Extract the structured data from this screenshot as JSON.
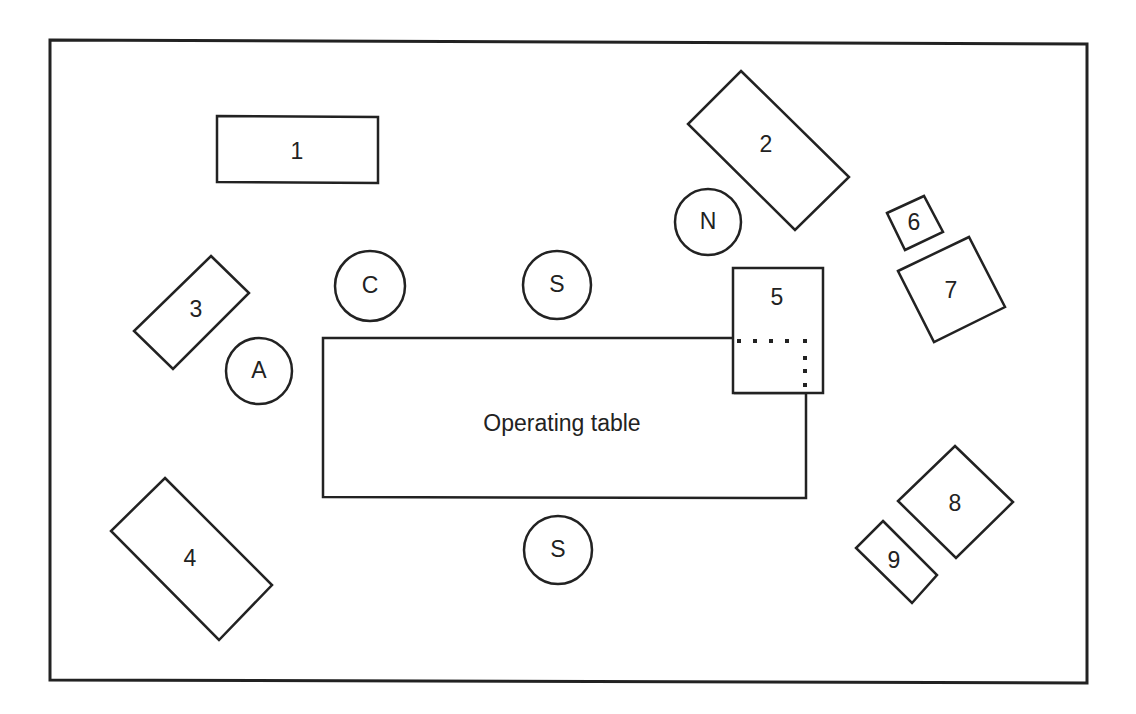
{
  "diagram": {
    "colors": {
      "stroke": "#222222",
      "background": "#ffffff"
    },
    "room": {
      "points": [
        [
          50,
          40
        ],
        [
          1087,
          44
        ],
        [
          1087,
          683
        ],
        [
          50,
          680
        ]
      ]
    },
    "table": {
      "label": "Operating table",
      "points": [
        [
          323,
          338
        ],
        [
          735,
          338
        ],
        [
          735,
          393
        ],
        [
          806,
          393
        ],
        [
          806,
          498
        ],
        [
          323,
          497
        ]
      ],
      "label_x": 562,
      "label_y": 425
    },
    "table_extension": {
      "dots": [
        [
          739,
          341
        ],
        [
          755,
          341
        ],
        [
          771,
          341
        ],
        [
          787,
          341
        ],
        [
          805,
          341
        ],
        [
          805,
          358
        ],
        [
          805,
          371
        ],
        [
          805,
          385
        ]
      ]
    },
    "equipment": [
      {
        "id": "1",
        "label": "1",
        "points": [
          [
            217,
            116
          ],
          [
            378,
            117
          ],
          [
            378,
            183
          ],
          [
            217,
            182
          ]
        ],
        "lx": 297,
        "ly": 153
      },
      {
        "id": "2",
        "label": "2",
        "points": [
          [
            741,
            71
          ],
          [
            849,
            177
          ],
          [
            795,
            230
          ],
          [
            688,
            124
          ]
        ],
        "lx": 766,
        "ly": 146
      },
      {
        "id": "3",
        "label": "3",
        "points": [
          [
            211,
            256
          ],
          [
            249,
            293
          ],
          [
            173,
            369
          ],
          [
            134,
            331
          ]
        ],
        "lx": 196,
        "ly": 311
      },
      {
        "id": "4",
        "label": "4",
        "points": [
          [
            165,
            478
          ],
          [
            272,
            585
          ],
          [
            219,
            640
          ],
          [
            111,
            531
          ]
        ],
        "lx": 190,
        "ly": 560
      },
      {
        "id": "5",
        "label": "5",
        "points": [
          [
            733,
            268
          ],
          [
            823,
            268
          ],
          [
            823,
            393
          ],
          [
            733,
            393
          ]
        ],
        "lx": 777,
        "ly": 299
      },
      {
        "id": "6",
        "label": "6",
        "points": [
          [
            887,
            213
          ],
          [
            924,
            196
          ],
          [
            943,
            232
          ],
          [
            905,
            250
          ]
        ],
        "lx": 914,
        "ly": 224
      },
      {
        "id": "7",
        "label": "7",
        "points": [
          [
            898,
            271
          ],
          [
            969,
            237
          ],
          [
            1005,
            307
          ],
          [
            934,
            342
          ]
        ],
        "lx": 951,
        "ly": 292
      },
      {
        "id": "8",
        "label": "8",
        "points": [
          [
            955,
            446
          ],
          [
            1013,
            502
          ],
          [
            956,
            558
          ],
          [
            898,
            501
          ]
        ],
        "lx": 955,
        "ly": 505
      },
      {
        "id": "9",
        "label": "9",
        "points": [
          [
            883,
            521
          ],
          [
            937,
            575
          ],
          [
            912,
            603
          ],
          [
            856,
            548
          ]
        ],
        "lx": 894,
        "ly": 562
      }
    ],
    "personnel": [
      {
        "id": "N",
        "label": "N",
        "role": "Nurse",
        "cx": 708,
        "cy": 222,
        "r": 33
      },
      {
        "id": "C",
        "label": "C",
        "role": "Circulating",
        "cx": 370,
        "cy": 286,
        "r": 35
      },
      {
        "id": "S1",
        "label": "S",
        "role": "Surgeon",
        "cx": 557,
        "cy": 285,
        "r": 34
      },
      {
        "id": "A",
        "label": "A",
        "role": "Anesthetist",
        "cx": 259,
        "cy": 371,
        "r": 33
      },
      {
        "id": "S2",
        "label": "S",
        "role": "Surgeon",
        "cx": 558,
        "cy": 550,
        "r": 34
      }
    ]
  }
}
